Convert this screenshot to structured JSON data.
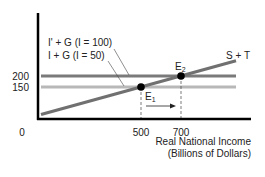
{
  "chart_data": {
    "type": "line",
    "title": "",
    "xlabel": "Real National Income",
    "xlabel_units": "(Billions of Dollars)",
    "ylabel": "",
    "xlim": [
      0,
      1060
    ],
    "ylim": [
      0,
      430
    ],
    "x_ticks": [
      {
        "value": 0,
        "label": "0"
      },
      {
        "value": 500,
        "label": "500"
      },
      {
        "value": 700,
        "label": "700"
      }
    ],
    "y_ticks": [
      {
        "value": 150,
        "label": "150"
      },
      {
        "value": 200,
        "label": "200"
      }
    ],
    "grid": false,
    "series": [
      {
        "name": "I' + G (I = 100)",
        "kind": "horizontal",
        "color": "#7a7a7a",
        "points": [
          [
            0,
            200
          ],
          [
            975,
            200
          ]
        ]
      },
      {
        "name": "I + G (I = 50)",
        "kind": "horizontal",
        "color": "#b8b8b8",
        "points": [
          [
            0,
            150
          ],
          [
            975,
            150
          ]
        ]
      },
      {
        "name": "S + T",
        "kind": "sloped",
        "color": "#707070",
        "points": [
          [
            0,
            25
          ],
          [
            975,
            269
          ]
        ]
      }
    ],
    "equilibria": [
      {
        "name": "E",
        "sub": "1",
        "x": 500,
        "y": 150
      },
      {
        "name": "E",
        "sub": "2",
        "x": 700,
        "y": 200
      }
    ],
    "annotations": {
      "series_labels": [
        "I' + G (I = 100)",
        "I + G (I = 50)",
        "S + T"
      ],
      "shift_arrow": {
        "from": 500,
        "to": 700
      }
    }
  }
}
